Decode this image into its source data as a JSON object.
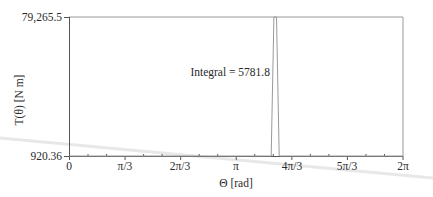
{
  "chart_data": {
    "type": "line",
    "title": "",
    "xlabel": "Θ [rad]",
    "ylabel": "T(θ) [N m]",
    "xlim": [
      0,
      6.2832
    ],
    "ylim": [
      920.36,
      79265.5
    ],
    "grid": false,
    "legend": null,
    "x_tick_labels": [
      "0",
      "π/3",
      "2π/3",
      "π",
      "4π/3",
      "5π/3",
      "2π"
    ],
    "x_tick_values": [
      0,
      1.0472,
      2.0944,
      3.1416,
      4.1888,
      5.236,
      6.2832
    ],
    "y_tick_labels": [
      "79,265.5",
      "920.36"
    ],
    "y_tick_values": [
      79265.5,
      920.36
    ],
    "annotation": "Integral = 5781.8",
    "series": [
      {
        "name": "T(θ)",
        "color": "#9a9a9a",
        "x": [
          0,
          3.8,
          3.85,
          3.9,
          3.95,
          6.2832
        ],
        "y": [
          920.36,
          920.36,
          79265.5,
          79265.5,
          920.36,
          920.36
        ]
      }
    ]
  },
  "labels": {
    "y_max": "79,265.5",
    "y_min": "920.36",
    "x_ticks": [
      "0",
      "π/3",
      "2π/3",
      "π",
      "4π/3",
      "5π/3",
      "2π"
    ],
    "x_axis": "Θ [rad]",
    "y_axis": "T(θ) [N m]",
    "annotation": "Integral = 5781.8"
  },
  "colors": {
    "axis": "#555555",
    "frame": "#9a9a9a",
    "series": "#9a9a9a",
    "artifact": "#e6e6e6"
  }
}
